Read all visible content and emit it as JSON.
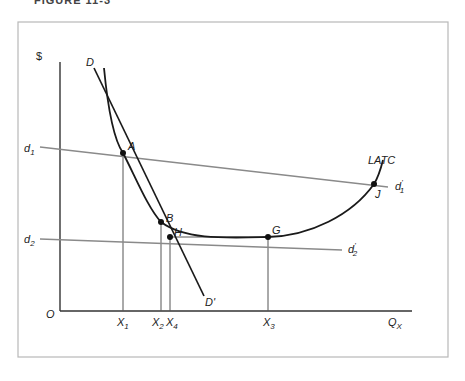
{
  "figure": {
    "caption": "FIGURE 11-3"
  },
  "axes": {
    "y_label": "$",
    "x_label": "Q",
    "x_label_sub": "X",
    "origin": "O"
  },
  "curves": {
    "demand_line": {
      "label_start": "D",
      "label_end": "D",
      "label_end_prime": "'"
    },
    "latc": {
      "label": "LATC"
    },
    "d1": {
      "label": "d",
      "sub": "1",
      "prime": "'"
    },
    "d2": {
      "label": "d",
      "sub": "2",
      "prime": "'"
    }
  },
  "points": {
    "A": "A",
    "B": "B",
    "H": "H",
    "G": "G",
    "J": "J"
  },
  "x_ticks": [
    {
      "label": "X",
      "sub": "1"
    },
    {
      "label": "X",
      "sub": "2"
    },
    {
      "label": "X",
      "sub": "4"
    },
    {
      "label": "X",
      "sub": "3"
    }
  ],
  "colors": {
    "frame": "#b8b8b8",
    "axis": "#333333",
    "curve": "#1a1a1a",
    "demand_lines": "#8a8a8a",
    "guides": "#555555"
  }
}
